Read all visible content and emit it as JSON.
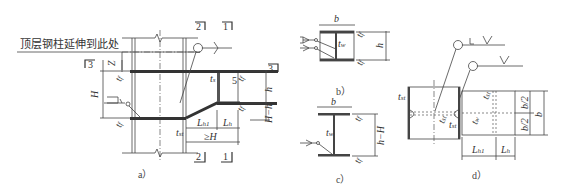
{
  "annotation": {
    "top_column_note": "顶层钢柱延伸到此处"
  },
  "figures": [
    {
      "id": "a",
      "caption": "a）"
    },
    {
      "id": "b",
      "caption": "b）"
    },
    {
      "id": "c",
      "caption": "c）"
    },
    {
      "id": "d",
      "caption": "d）"
    }
  ],
  "section_marks": [
    "1",
    "2",
    "3",
    "5"
  ],
  "fig_a": {
    "labels": {
      "Z": "Z",
      "H": "H",
      "h": "h",
      "H_minus_h": "H−h",
      "tf": "t",
      "tf_sub": "f",
      "ts": "t",
      "ts_sub": "s",
      "tst": "t",
      "tst_sub": "st",
      "Lh1": "L",
      "Lh1_sub": "h1",
      "Lh": "L",
      "Lh_sub": "h",
      "geH": "≥H",
      "mark5": "5",
      "mark3": "3",
      "mark2": "2",
      "mark1": "1"
    }
  },
  "fig_b": {
    "labels": {
      "b": "b",
      "h": "h",
      "tw": "t",
      "tw_sub": "w",
      "tf": "t",
      "tf_sub": "f"
    }
  },
  "fig_c": {
    "labels": {
      "b": "b",
      "h_minus_H": "h−H",
      "tw": "t",
      "tw_sub": "w",
      "tf": "t",
      "tf_sub": "f"
    }
  },
  "fig_d": {
    "labels": {
      "b": "b",
      "b_half_1": "b/2",
      "b_half_2": "b/2",
      "tst": "t",
      "tst_sub": "st",
      "tw": "t",
      "tw_sub": "w",
      "Lh1": "L",
      "Lh1_sub": "h1",
      "Lh": "L",
      "Lh_sub": "h"
    }
  }
}
